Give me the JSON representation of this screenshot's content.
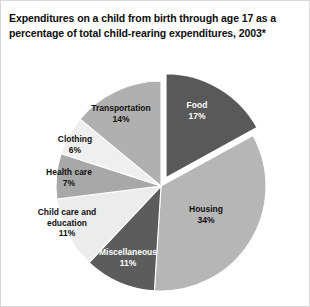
{
  "chart_data": {
    "type": "pie",
    "title": "Expenditures on a child from birth through age 17 as a percentage of total child-rearing expenditures, 2003*",
    "xlabel": "",
    "ylabel": "",
    "legend_position": "none",
    "grid": false,
    "units": "percent",
    "total": 100,
    "categories": [
      "Food",
      "Housing",
      "Miscellaneous",
      "Child care and education",
      "Health care",
      "Clothing",
      "Transportation"
    ],
    "values": [
      17,
      34,
      11,
      11,
      7,
      6,
      14
    ],
    "slices": [
      {
        "label": "Food",
        "value": 17,
        "pct_text": "17%",
        "color": "#595959",
        "text_color": "#ffffff",
        "exploded": true
      },
      {
        "label": "Housing",
        "value": 34,
        "pct_text": "34%",
        "color": "#b6b6b6",
        "text_color": "#111111",
        "exploded": false
      },
      {
        "label": "Miscellaneous",
        "value": 11,
        "pct_text": "11%",
        "color": "#5c5c5c",
        "text_color": "#ffffff",
        "exploded": false
      },
      {
        "label": "Child care and education",
        "value": 11,
        "pct_text": "11%",
        "color": "#ececec",
        "text_color": "#111111",
        "exploded": false
      },
      {
        "label": "Health care",
        "value": 7,
        "pct_text": "7%",
        "color": "#a8a8a8",
        "text_color": "#111111",
        "exploded": false
      },
      {
        "label": "Clothing",
        "value": 6,
        "pct_text": "6%",
        "color": "#efefef",
        "text_color": "#111111",
        "exploded": false
      },
      {
        "label": "Transportation",
        "value": 14,
        "pct_text": "14%",
        "color": "#b0b0b0",
        "text_color": "#111111",
        "exploded": false
      }
    ]
  },
  "labels": {
    "food": {
      "name": "Food",
      "pct": "17%"
    },
    "housing": {
      "name": "Housing",
      "pct": "34%"
    },
    "miscellaneous": {
      "name": "Miscellaneous",
      "pct": "11%"
    },
    "childcare": {
      "name_line1": "Child care and",
      "name_line2": "education",
      "pct": "11%"
    },
    "healthcare": {
      "name": "Health care",
      "pct": "7%"
    },
    "clothing": {
      "name": "Clothing",
      "pct": "6%"
    },
    "transportation": {
      "name": "Transportation",
      "pct": "14%"
    }
  },
  "colors": {
    "background": "#ffffff",
    "border": "#d8d8d8",
    "title_text": "#0d0d0d",
    "dark_slice": "#595959",
    "mid_slice": "#b0b0b0",
    "light_slice": "#ececec"
  }
}
